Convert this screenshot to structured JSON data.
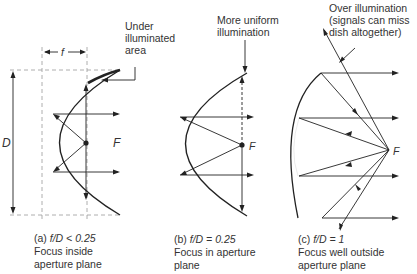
{
  "figure": {
    "panels": [
      {
        "id": "a",
        "caption_tag": "(a)",
        "ratio_label": "f/D < 0.25",
        "caption_line2": "Focus inside",
        "caption_line3": "aperture plane",
        "annotation": [
          "Under",
          "illuminated",
          "area"
        ],
        "focus_label": "F",
        "dimension_f": "f",
        "dimension_D": "D"
      },
      {
        "id": "b",
        "caption_tag": "(b)",
        "ratio_label": "f/D = 0.25",
        "caption_line2": "Focus in aperture",
        "caption_line3": "plane",
        "annotation": [
          "More uniform",
          "illumination"
        ],
        "focus_label": "F"
      },
      {
        "id": "c",
        "caption_tag": "(c)",
        "ratio_label": "f/D = 1",
        "caption_line2": "Focus well outside",
        "caption_line3": "aperture plane",
        "annotation": [
          "Over illumination",
          "(signals can miss",
          "dish altogether)"
        ],
        "focus_label": "F"
      }
    ],
    "colors": {
      "line": "#222222",
      "dashed": "#999999",
      "text": "#333333"
    }
  }
}
